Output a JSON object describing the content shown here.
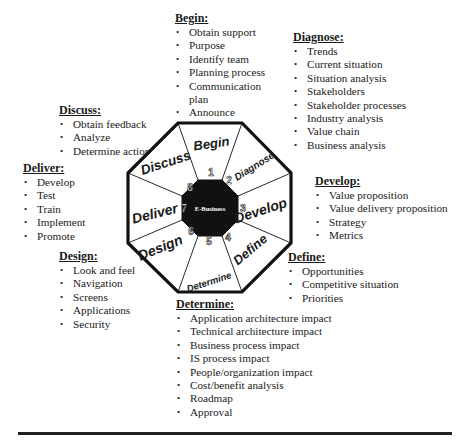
{
  "diagram": {
    "center_label": "E-Business",
    "segments": [
      {
        "number": "1",
        "label": "Begin"
      },
      {
        "number": "2",
        "label": "Diagnose"
      },
      {
        "number": "3",
        "label": "Develop"
      },
      {
        "number": "4",
        "label": "Define"
      },
      {
        "number": "5",
        "label": "Determine"
      },
      {
        "number": "6",
        "label": "Design"
      },
      {
        "number": "7",
        "label": "Deliver"
      },
      {
        "number": "8",
        "label": "Discuss"
      }
    ]
  },
  "phases": {
    "begin": {
      "title": "Begin:",
      "items": [
        "Obtain support",
        "Purpose",
        "Identify team",
        "Planning process",
        "Communication plan",
        "Announce"
      ]
    },
    "diagnose": {
      "title": "Diagnose:",
      "items": [
        "Trends",
        "Current situation",
        "Situation analysis",
        "Stakeholders",
        "Stakeholder processes",
        "Industry analysis",
        "Value chain",
        "Business analysis"
      ]
    },
    "develop": {
      "title": "Develop:",
      "items": [
        "Value proposition",
        "Value delivery proposition",
        "Strategy",
        "Metrics"
      ]
    },
    "define": {
      "title": "Define:",
      "items": [
        "Opportunities",
        "Competitive situation",
        "Priorities"
      ]
    },
    "determine": {
      "title": "Determine:",
      "items": [
        "Application architecture impact",
        "Technical architecture impact",
        "Business process impact",
        "IS process impact",
        "People/organization impact",
        "Cost/benefit analysis",
        "Roadmap",
        "Approval"
      ]
    },
    "design": {
      "title": "Design:",
      "items": [
        "Look and feel",
        "Navigation",
        "Screens",
        "Applications",
        "Security"
      ]
    },
    "deliver": {
      "title": "Deliver:",
      "items": [
        "Develop",
        "Test",
        "Train",
        "Implement",
        "Promote"
      ]
    },
    "discuss": {
      "title": "Discuss:",
      "items": [
        "Obtain feedback",
        "Analyze",
        "Determine action"
      ]
    }
  }
}
